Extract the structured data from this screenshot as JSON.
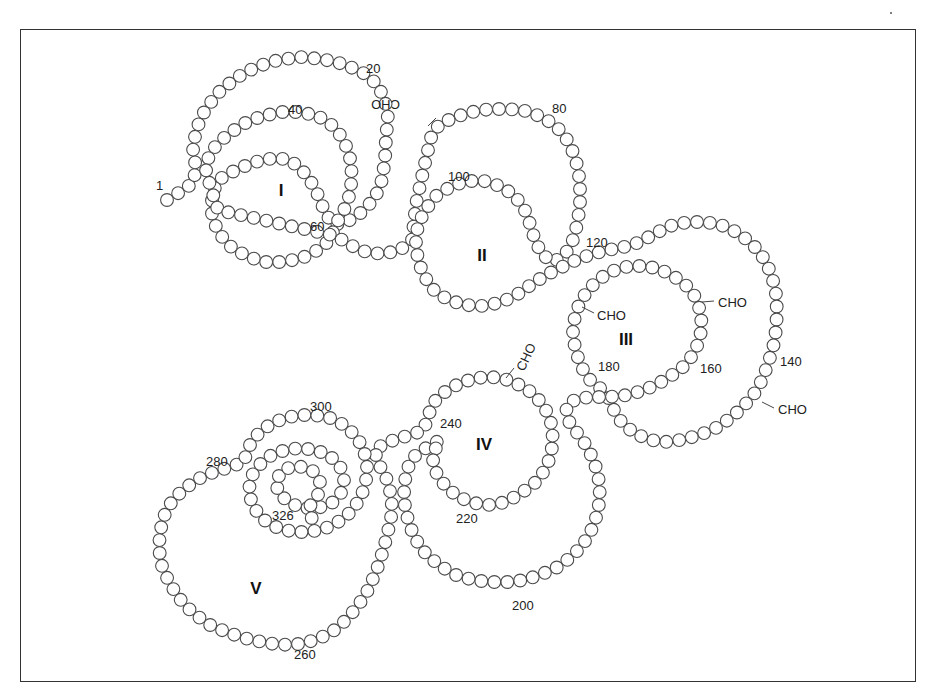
{
  "diagram": {
    "residue_count": 326,
    "bead_spacing": 13,
    "bead_radius": 6.4,
    "path": [
      [
        167,
        200
      ],
      [
        180,
        192
      ],
      [
        193,
        183
      ],
      [
        196,
        168
      ],
      [
        193,
        150
      ],
      [
        196,
        130
      ],
      [
        205,
        110
      ],
      [
        218,
        93
      ],
      [
        236,
        78
      ],
      [
        256,
        67
      ],
      [
        278,
        60
      ],
      [
        300,
        57
      ],
      [
        322,
        59
      ],
      [
        343,
        64
      ],
      [
        362,
        72
      ],
      [
        377,
        84
      ],
      [
        385,
        100
      ],
      [
        388,
        118
      ],
      [
        386,
        138
      ],
      [
        385,
        160
      ],
      [
        382,
        180
      ],
      [
        375,
        198
      ],
      [
        362,
        212
      ],
      [
        347,
        222
      ],
      [
        333,
        225
      ],
      [
        325,
        212
      ],
      [
        318,
        195
      ],
      [
        310,
        180
      ],
      [
        302,
        170
      ],
      [
        290,
        160
      ],
      [
        276,
        158
      ],
      [
        262,
        160
      ],
      [
        247,
        165
      ],
      [
        232,
        172
      ],
      [
        218,
        180
      ],
      [
        212,
        195
      ],
      [
        212,
        215
      ],
      [
        218,
        232
      ],
      [
        230,
        246
      ],
      [
        246,
        256
      ],
      [
        264,
        262
      ],
      [
        284,
        262
      ],
      [
        302,
        258
      ],
      [
        318,
        250
      ],
      [
        330,
        240
      ],
      [
        336,
        224
      ],
      [
        344,
        210
      ],
      [
        350,
        194
      ],
      [
        352,
        176
      ],
      [
        350,
        158
      ],
      [
        344,
        140
      ],
      [
        333,
        126
      ],
      [
        318,
        116
      ],
      [
        300,
        112
      ],
      [
        282,
        112
      ],
      [
        262,
        116
      ],
      [
        243,
        124
      ],
      [
        226,
        136
      ],
      [
        212,
        150
      ],
      [
        205,
        166
      ],
      [
        210,
        185
      ],
      [
        218,
        210
      ],
      [
        336,
        236
      ],
      [
        350,
        245
      ],
      [
        366,
        252
      ],
      [
        383,
        254
      ],
      [
        400,
        250
      ],
      [
        412,
        240
      ],
      [
        414,
        222
      ],
      [
        416,
        204
      ],
      [
        420,
        186
      ],
      [
        424,
        168
      ],
      [
        428,
        150
      ],
      [
        432,
        134
      ],
      [
        440,
        124
      ],
      [
        455,
        117
      ],
      [
        472,
        112
      ],
      [
        490,
        109
      ],
      [
        508,
        109
      ],
      [
        526,
        111
      ],
      [
        542,
        117
      ],
      [
        556,
        126
      ],
      [
        566,
        138
      ],
      [
        573,
        152
      ],
      [
        578,
        168
      ],
      [
        580,
        185
      ],
      [
        580,
        202
      ],
      [
        578,
        220
      ],
      [
        574,
        238
      ],
      [
        566,
        253
      ],
      [
        554,
        262
      ],
      [
        542,
        255
      ],
      [
        535,
        240
      ],
      [
        530,
        224
      ],
      [
        524,
        208
      ],
      [
        514,
        195
      ],
      [
        500,
        186
      ],
      [
        484,
        181
      ],
      [
        466,
        181
      ],
      [
        450,
        187
      ],
      [
        436,
        196
      ],
      [
        426,
        209
      ],
      [
        418,
        224
      ],
      [
        416,
        242
      ],
      [
        418,
        260
      ],
      [
        424,
        276
      ],
      [
        434,
        290
      ],
      [
        448,
        300
      ],
      [
        466,
        305
      ],
      [
        484,
        306
      ],
      [
        502,
        302
      ],
      [
        518,
        294
      ],
      [
        532,
        284
      ],
      [
        546,
        275
      ],
      [
        560,
        268
      ],
      [
        576,
        260
      ],
      [
        592,
        254
      ],
      [
        608,
        250
      ],
      [
        624,
        247
      ],
      [
        640,
        242
      ],
      [
        654,
        234
      ],
      [
        670,
        226
      ],
      [
        688,
        222
      ],
      [
        706,
        222
      ],
      [
        724,
        226
      ],
      [
        740,
        234
      ],
      [
        754,
        246
      ],
      [
        765,
        260
      ],
      [
        772,
        276
      ],
      [
        776,
        294
      ],
      [
        777,
        312
      ],
      [
        776,
        330
      ],
      [
        773,
        348
      ],
      [
        768,
        364
      ],
      [
        762,
        380
      ],
      [
        754,
        394
      ],
      [
        744,
        406
      ],
      [
        732,
        417
      ],
      [
        718,
        427
      ],
      [
        702,
        434
      ],
      [
        686,
        439
      ],
      [
        668,
        442
      ],
      [
        650,
        440
      ],
      [
        634,
        433
      ],
      [
        622,
        423
      ],
      [
        614,
        410
      ],
      [
        608,
        397
      ],
      [
        600,
        388
      ],
      [
        588,
        378
      ],
      [
        580,
        364
      ],
      [
        575,
        348
      ],
      [
        573,
        332
      ],
      [
        575,
        316
      ],
      [
        580,
        302
      ],
      [
        588,
        290
      ],
      [
        598,
        280
      ],
      [
        610,
        272
      ],
      [
        624,
        267
      ],
      [
        640,
        266
      ],
      [
        656,
        268
      ],
      [
        670,
        274
      ],
      [
        684,
        283
      ],
      [
        694,
        295
      ],
      [
        700,
        310
      ],
      [
        702,
        326
      ],
      [
        699,
        342
      ],
      [
        692,
        356
      ],
      [
        682,
        368
      ],
      [
        668,
        378
      ],
      [
        654,
        386
      ],
      [
        638,
        392
      ],
      [
        622,
        396
      ],
      [
        606,
        397
      ],
      [
        590,
        397
      ],
      [
        576,
        399
      ],
      [
        566,
        406
      ],
      [
        568,
        420
      ],
      [
        578,
        434
      ],
      [
        588,
        448
      ],
      [
        595,
        464
      ],
      [
        599,
        481
      ],
      [
        600,
        498
      ],
      [
        597,
        515
      ],
      [
        591,
        531
      ],
      [
        582,
        546
      ],
      [
        570,
        558
      ],
      [
        556,
        568
      ],
      [
        540,
        575
      ],
      [
        524,
        580
      ],
      [
        507,
        582
      ],
      [
        490,
        582
      ],
      [
        473,
        580
      ],
      [
        456,
        575
      ],
      [
        440,
        566
      ],
      [
        426,
        554
      ],
      [
        416,
        540
      ],
      [
        409,
        524
      ],
      [
        405,
        507
      ],
      [
        404,
        490
      ],
      [
        406,
        473
      ],
      [
        412,
        458
      ],
      [
        426,
        448
      ],
      [
        440,
        440
      ],
      [
        432,
        456
      ],
      [
        436,
        472
      ],
      [
        445,
        486
      ],
      [
        458,
        497
      ],
      [
        474,
        503
      ],
      [
        490,
        505
      ],
      [
        506,
        502
      ],
      [
        520,
        494
      ],
      [
        534,
        484
      ],
      [
        545,
        470
      ],
      [
        551,
        455
      ],
      [
        553,
        439
      ],
      [
        551,
        423
      ],
      [
        545,
        408
      ],
      [
        535,
        395
      ],
      [
        522,
        386
      ],
      [
        508,
        380
      ],
      [
        492,
        377
      ],
      [
        476,
        378
      ],
      [
        460,
        383
      ],
      [
        446,
        391
      ],
      [
        434,
        402
      ],
      [
        428,
        416
      ],
      [
        424,
        430
      ],
      [
        414,
        434
      ],
      [
        400,
        438
      ],
      [
        386,
        443
      ],
      [
        374,
        450
      ],
      [
        380,
        466
      ],
      [
        388,
        482
      ],
      [
        392,
        500
      ],
      [
        391,
        518
      ],
      [
        387,
        536
      ],
      [
        382,
        554
      ],
      [
        376,
        572
      ],
      [
        368,
        590
      ],
      [
        358,
        606
      ],
      [
        346,
        620
      ],
      [
        332,
        632
      ],
      [
        316,
        640
      ],
      [
        298,
        644
      ],
      [
        280,
        645
      ],
      [
        262,
        642
      ],
      [
        244,
        638
      ],
      [
        226,
        632
      ],
      [
        208,
        624
      ],
      [
        192,
        612
      ],
      [
        179,
        598
      ],
      [
        169,
        582
      ],
      [
        162,
        566
      ],
      [
        159,
        549
      ],
      [
        160,
        532
      ],
      [
        164,
        516
      ],
      [
        172,
        501
      ],
      [
        184,
        489
      ],
      [
        198,
        479
      ],
      [
        214,
        472
      ],
      [
        230,
        467
      ],
      [
        244,
        462
      ],
      [
        248,
        448
      ],
      [
        256,
        436
      ],
      [
        268,
        426
      ],
      [
        282,
        419
      ],
      [
        298,
        415
      ],
      [
        314,
        415
      ],
      [
        330,
        418
      ],
      [
        344,
        425
      ],
      [
        356,
        436
      ],
      [
        364,
        450
      ],
      [
        367,
        466
      ],
      [
        366,
        482
      ],
      [
        361,
        497
      ],
      [
        352,
        511
      ],
      [
        340,
        521
      ],
      [
        326,
        528
      ],
      [
        310,
        532
      ],
      [
        294,
        532
      ],
      [
        278,
        528
      ],
      [
        264,
        520
      ],
      [
        254,
        508
      ],
      [
        249,
        494
      ],
      [
        250,
        479
      ],
      [
        258,
        466
      ],
      [
        270,
        456
      ],
      [
        285,
        450
      ],
      [
        300,
        448
      ],
      [
        316,
        450
      ],
      [
        330,
        456
      ],
      [
        340,
        466
      ],
      [
        344,
        480
      ],
      [
        341,
        493
      ],
      [
        332,
        503
      ],
      [
        318,
        508
      ],
      [
        302,
        508
      ],
      [
        288,
        502
      ],
      [
        278,
        492
      ],
      [
        276,
        480
      ],
      [
        284,
        469
      ],
      [
        298,
        466
      ],
      [
        312,
        470
      ],
      [
        320,
        481
      ],
      [
        318,
        495
      ],
      [
        310,
        506
      ],
      [
        312,
        520
      ]
    ],
    "residue_labels": [
      {
        "text": "1",
        "x": 156,
        "y": 190
      },
      {
        "text": "20",
        "x": 366,
        "y": 73
      },
      {
        "text": "40",
        "x": 288,
        "y": 114
      },
      {
        "text": "60",
        "x": 310,
        "y": 231
      },
      {
        "text": "80",
        "x": 552,
        "y": 113
      },
      {
        "text": "100",
        "x": 448,
        "y": 181
      },
      {
        "text": "120",
        "x": 586,
        "y": 247
      },
      {
        "text": "140",
        "x": 780,
        "y": 366
      },
      {
        "text": "160",
        "x": 700,
        "y": 373
      },
      {
        "text": "180",
        "x": 598,
        "y": 371
      },
      {
        "text": "200",
        "x": 512,
        "y": 610
      },
      {
        "text": "220",
        "x": 456,
        "y": 523
      },
      {
        "text": "240",
        "x": 440,
        "y": 428
      },
      {
        "text": "260",
        "x": 294,
        "y": 659
      },
      {
        "text": "280",
        "x": 206,
        "y": 466
      },
      {
        "text": "300",
        "x": 310,
        "y": 411
      },
      {
        "text": "326",
        "x": 272,
        "y": 520
      }
    ],
    "domains": [
      {
        "label": "I",
        "x": 281,
        "y": 196
      },
      {
        "label": "II",
        "x": 482,
        "y": 261
      },
      {
        "label": "III",
        "x": 626,
        "y": 345
      },
      {
        "label": "IV",
        "x": 484,
        "y": 450
      },
      {
        "label": "V",
        "x": 256,
        "y": 594
      }
    ],
    "glycosylation_sites": [
      {
        "text": "CHO",
        "x": 400,
        "y": 100,
        "rotate": 180,
        "tick": [
          428,
          126,
          436,
          118
        ]
      },
      {
        "text": "CHO",
        "x": 597,
        "y": 320,
        "rotate": 0,
        "tick": [
          582,
          307,
          594,
          313
        ]
      },
      {
        "text": "CHO",
        "x": 718,
        "y": 307,
        "rotate": 0,
        "tick": [
          702,
          302,
          714,
          301
        ]
      },
      {
        "text": "CHO",
        "x": 778,
        "y": 414,
        "rotate": 0,
        "tick": [
          762,
          402,
          774,
          408
        ]
      },
      {
        "text": "CHO",
        "x": 524,
        "y": 372,
        "rotate": -65,
        "tick": [
          506,
          378,
          514,
          368
        ]
      }
    ],
    "colors": {
      "bead_stroke": "#4a4a4a",
      "bead_fill": "#ffffff",
      "text": "#222222",
      "frame": "#333333"
    }
  }
}
